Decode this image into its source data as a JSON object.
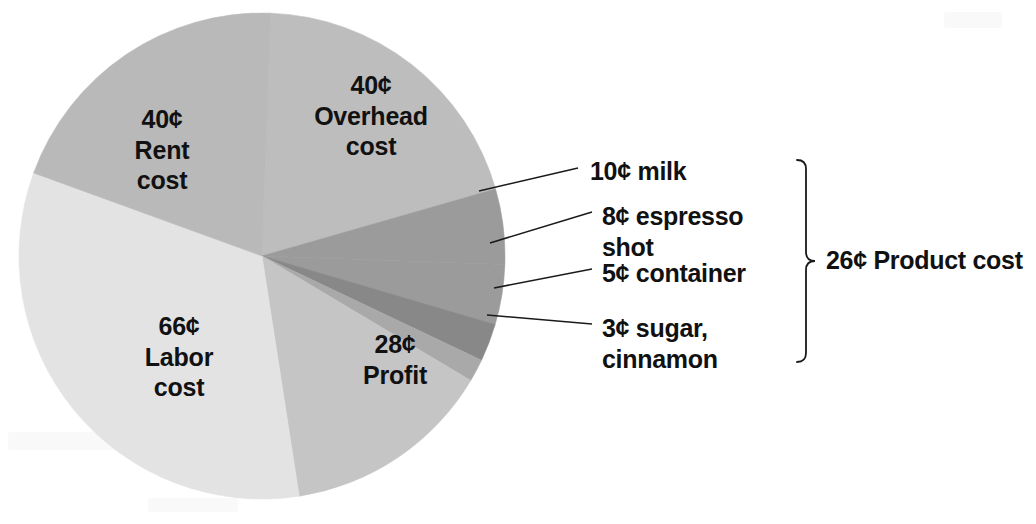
{
  "chart_data": {
    "type": "pie",
    "title": "",
    "unit": "¢",
    "total": 180,
    "center": {
      "x": 262,
      "y": 256
    },
    "radius": 243,
    "start_angle_deg": -88,
    "direction": "clockwise",
    "legend": "in-slice labels and leader-line callouts",
    "grid": false,
    "categories": [
      "Overhead cost",
      "milk",
      "espresso shot",
      "container",
      "sugar, cinnamon",
      "Profit",
      "Labor cost",
      "Rent cost"
    ],
    "values": [
      40,
      10,
      8,
      5,
      3,
      28,
      66,
      40
    ],
    "colors": [
      "#bdbdbd",
      "#9b9b9b",
      "#9b9b9b",
      "#888888",
      "#a9a9a9",
      "#c5c5c5",
      "#e3e3e3",
      "#b9b9b9"
    ],
    "grouped": {
      "label": "26¢ Product cost",
      "amount": 26,
      "members": [
        "milk",
        "espresso shot",
        "container",
        "sugar, cinnamon"
      ]
    }
  },
  "pie_labels": [
    {
      "name": "overhead",
      "amount": "40¢",
      "text": "40¢\nOverhead\ncost",
      "x": 276,
      "y": 70,
      "w": 190
    },
    {
      "name": "rent",
      "amount": "40¢",
      "text": "40¢\nRent\ncost",
      "x": 92,
      "y": 104,
      "w": 140
    },
    {
      "name": "labor",
      "amount": "66¢",
      "text": "66¢\nLabor\ncost",
      "x": 104,
      "y": 311,
      "w": 150
    },
    {
      "name": "profit",
      "amount": "28¢",
      "text": "28¢\nProfit",
      "x": 340,
      "y": 329,
      "w": 110
    }
  ],
  "callouts": [
    {
      "name": "milk",
      "text": "10¢ milk",
      "x": 590,
      "y": 156,
      "leader": {
        "x1": 479,
        "y1": 191,
        "x2": 578,
        "y2": 168
      }
    },
    {
      "name": "espresso",
      "text": "8¢ espresso\n    shot",
      "x": 602,
      "y": 201,
      "leader": {
        "x1": 490,
        "y1": 243,
        "x2": 592,
        "y2": 212
      }
    },
    {
      "name": "container",
      "text": "5¢ container",
      "x": 602,
      "y": 258,
      "leader": {
        "x1": 494,
        "y1": 288,
        "x2": 592,
        "y2": 269
      }
    },
    {
      "name": "sugar",
      "text": "3¢ sugar,\n    cinnamon",
      "x": 602,
      "y": 313,
      "leader": {
        "x1": 487,
        "y1": 315,
        "x2": 592,
        "y2": 324
      }
    }
  ],
  "bracket": {
    "name": "product-cost-bracket",
    "x": 806,
    "y_top": 160,
    "y_bottom": 362,
    "tick_x": 820,
    "tick_y": 261
  },
  "group_total": {
    "label": "26¢ Product cost",
    "x": 826,
    "y": 246
  }
}
